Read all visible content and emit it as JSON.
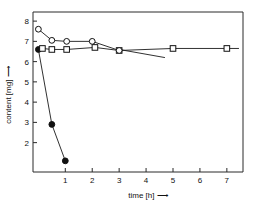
{
  "chart_data": {
    "type": "line",
    "title": "",
    "xlabel": "time [h]",
    "ylabel": "content [mg]",
    "xlim": [
      -0.2,
      7.6
    ],
    "ylim": [
      0.55,
      8.45
    ],
    "xticks": [
      1,
      2,
      3,
      4,
      5,
      6,
      7
    ],
    "xtick_labels": [
      "1",
      "2",
      "3",
      "4",
      "5",
      "6",
      "7"
    ],
    "yticks": [
      2,
      3,
      4,
      5,
      6,
      7,
      8
    ],
    "ytick_labels": [
      "2",
      "3",
      "4",
      "5",
      "6",
      "7",
      "8"
    ],
    "grid": false,
    "legend": "none",
    "axis_arrow_x": "⟶",
    "axis_arrow_y": "⟶",
    "series": [
      {
        "name": "degrading-sample-filled-circles",
        "marker": "filled-circle",
        "x": [
          0.0,
          0.5,
          1.0
        ],
        "y": [
          6.6,
          2.9,
          1.1
        ]
      },
      {
        "name": "stable-sample-open-squares",
        "marker": "open-square",
        "x": [
          0.15,
          0.5,
          1.05,
          2.1,
          3.0,
          5.0,
          7.0
        ],
        "y": [
          6.65,
          6.6,
          6.6,
          6.7,
          6.55,
          6.65,
          6.65
        ]
      },
      {
        "name": "declining-sample-open-circles",
        "marker": "open-circle",
        "x": [
          0.0,
          0.5,
          1.05,
          2.0,
          3.0
        ],
        "y": [
          7.6,
          7.05,
          7.0,
          7.0,
          6.55
        ]
      },
      {
        "name": "slow-decline-branch",
        "marker": "none",
        "x": [
          3.0,
          4.7
        ],
        "y": [
          6.6,
          6.2
        ]
      },
      {
        "name": "tail-segment-right",
        "marker": "none",
        "x": [
          7.0,
          7.45
        ],
        "y": [
          6.65,
          6.65
        ]
      }
    ]
  }
}
